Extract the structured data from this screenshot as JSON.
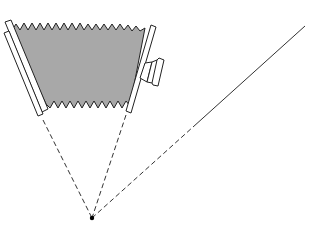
{
  "diagram": {
    "colors": {
      "background": "#ffffff",
      "stroke": "#222222",
      "bellows_fill": "#a8a8a8",
      "frame_fill": "#ffffff"
    },
    "parts": {
      "bellows": "pleated-bellows",
      "rear_standard": "rear-frame",
      "front_standard": "front-frame",
      "lens": "lens-barrel",
      "focal_point": "converging-point",
      "ray_left": "dashed-ray-left",
      "ray_right": "dashed-ray-right",
      "ray_outer": "dashed-to-solid-ray"
    },
    "geometry": {
      "focal_point": [
        92,
        218
      ],
      "ray_left_end": [
        43,
        120
      ],
      "ray_right_end": [
        126,
        115
      ],
      "outer_dash_end": [
        193,
        127
      ],
      "outer_solid_end": [
        305,
        26
      ]
    }
  }
}
